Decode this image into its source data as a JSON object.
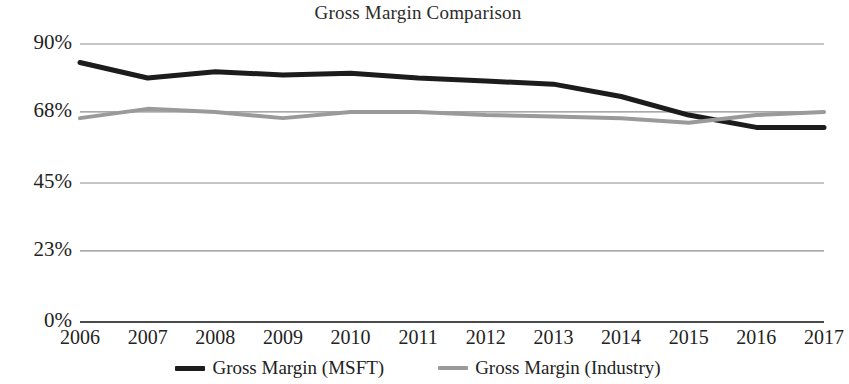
{
  "chart_data": {
    "type": "line",
    "title": "Gross Margin Comparison",
    "xlabel": "",
    "ylabel": "",
    "categories": [
      "2006",
      "2007",
      "2008",
      "2009",
      "2010",
      "2011",
      "2012",
      "2013",
      "2014",
      "2015",
      "2016",
      "2017"
    ],
    "ytick_labels": [
      "0%",
      "23%",
      "45%",
      "68%",
      "90%"
    ],
    "ytick_values": [
      0,
      23,
      45,
      68,
      90
    ],
    "ylim": [
      0,
      90
    ],
    "grid": true,
    "legend_position": "bottom",
    "series": [
      {
        "name": "Gross Margin (MSFT)",
        "color": "#1c1c1c",
        "width": 5,
        "values": [
          84,
          79,
          81,
          80,
          80.5,
          79,
          78,
          77,
          73,
          67,
          63,
          63
        ]
      },
      {
        "name": "Gross Margin (Industry)",
        "color": "#9a9a9a",
        "width": 4,
        "values": [
          66,
          69,
          68,
          66,
          68,
          68,
          67,
          66.5,
          66,
          64.5,
          67,
          68
        ]
      }
    ]
  },
  "legend": {
    "items": [
      {
        "label": "Gross Margin (MSFT)",
        "color": "#1c1c1c"
      },
      {
        "label": "Gross Margin (Industry)",
        "color": "#9a9a9a"
      }
    ]
  },
  "axis": {
    "gridline_color": "#8c8c8c",
    "axis_color": "#4a4a4a"
  }
}
